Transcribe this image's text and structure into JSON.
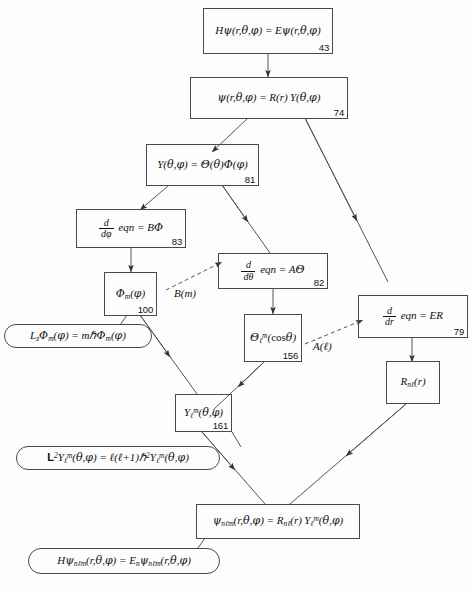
{
  "diagram": {
    "background_color": "#fdfdfd",
    "line_color": "#4a4a4a",
    "text_color": "#111111",
    "nodes": [
      {
        "id": "n43",
        "shape": "rect",
        "equation_html": "<i>H</i><span class=\"gr\">ψ</span>(<i>r</i>,<span class=\"gr\">θ</span>,<span class=\"gr\">φ</span>) = <i>E</i><span class=\"gr\">ψ</span>(<i>r</i>,<span class=\"gr\">θ</span>,<span class=\"gr\">φ</span>)",
        "page": "43"
      },
      {
        "id": "n74",
        "shape": "rect",
        "equation_html": "<span class=\"gr\">ψ</span>(<i>r</i>,<span class=\"gr\">θ</span>,<span class=\"gr\">φ</span>) = <i>R</i>(<i>r</i>) <i>Y</i>(<span class=\"gr\">θ</span>,<span class=\"gr\">φ</span>)",
        "page": "74"
      },
      {
        "id": "n81",
        "shape": "rect",
        "equation_html": "<i>Y</i>(<span class=\"gr\">θ</span>,<span class=\"gr\">φ</span>) = <span class=\"gr\">Θ</span>(<span class=\"gr\">θ</span>)<span class=\"gr\">Φ</span>(<span class=\"gr\">φ</span>)",
        "page": "81"
      },
      {
        "id": "n83",
        "shape": "rect",
        "equation_html": "FRAC:d:dφ <i>eqn</i> = <i>B</i><span class=\"gr\">Φ</span>",
        "page": "83"
      },
      {
        "id": "n82",
        "shape": "rect",
        "equation_html": "FRAC:d:dθ <i>eqn</i> = <i>A</i><span class=\"gr\">Θ</span>",
        "page": "82"
      },
      {
        "id": "n79",
        "shape": "rect",
        "equation_html": "FRAC:d:dr <i>eqn</i> = <i>ER</i>",
        "page": "79"
      },
      {
        "id": "n100",
        "shape": "rect",
        "equation_html": "<span class=\"gr\">Φ</span><sub>m</sub>(<span class=\"gr\">φ</span>)",
        "page": "100"
      },
      {
        "id": "n156",
        "shape": "rect",
        "equation_html": "<span class=\"gr\">Θ</span><sub>ℓ</sub><sup>m</sup>(<span class=\"up\">cos</span><span class=\"gr\">θ</span>)",
        "page": "156"
      },
      {
        "id": "nR",
        "shape": "rect",
        "equation_html": "<i>R</i><sub>nℓ</sub>(<i>r</i>)",
        "page": ""
      },
      {
        "id": "n161",
        "shape": "rect",
        "equation_html": "<i>Y</i><sub>ℓ</sub><sup>m</sup>(<span class=\"gr\">θ</span>,<span class=\"gr\">φ</span>)",
        "page": "161"
      },
      {
        "id": "npsi",
        "shape": "rect",
        "equation_html": "<span class=\"gr\">ψ</span><sub>nℓm</sub>(<i>r</i>,<span class=\"gr\">θ</span>,<span class=\"gr\">φ</span>) = <i>R</i><sub>nℓ</sub>(<i>r</i>) <i>Y</i><sub>ℓ</sub><sup>m</sup>(<span class=\"gr\">θ</span>,<span class=\"gr\">φ</span>)",
        "page": ""
      },
      {
        "id": "nLz",
        "shape": "rounded",
        "equation_html": "<i>L<sub>z</sub></i><span class=\"gr\">Φ</span><sub>m</sub>(<span class=\"gr\">φ</span>) = <i>m</i>ℏ<span class=\"gr\">Φ</span><sub>m</sub>(<span class=\"gr\">φ</span>)",
        "page": ""
      },
      {
        "id": "nL2",
        "shape": "rounded",
        "equation_html": "<span class=\"bold\">L</span><sup>2</sup><i>Y</i><sub>ℓ</sub><sup>m</sup>(<span class=\"gr\">θ</span>,<span class=\"gr\">φ</span>) = ℓ(ℓ+1)ℏ<sup>2</sup><i>Y</i><sub>ℓ</sub><sup>m</sup>(<span class=\"gr\">θ</span>,<span class=\"gr\">φ</span>)",
        "page": ""
      },
      {
        "id": "nH",
        "shape": "rounded",
        "equation_html": "<i>H</i><span class=\"gr\">ψ</span><sub>nℓm</sub>(<i>r</i>,<span class=\"gr\">θ</span>,<span class=\"gr\">φ</span>) = <i>E<sub>n</sub></i><span class=\"gr\">ψ</span><sub>nℓm</sub>(<i>r</i>,<span class=\"gr\">θ</span>,<span class=\"gr\">φ</span>)",
        "page": ""
      }
    ],
    "edge_labels": [
      {
        "id": "lbl_B",
        "text_html": "<i>B</i>(<i>m</i>)"
      },
      {
        "id": "lbl_A",
        "text_html": "<i>A</i>(ℓ)"
      }
    ]
  }
}
